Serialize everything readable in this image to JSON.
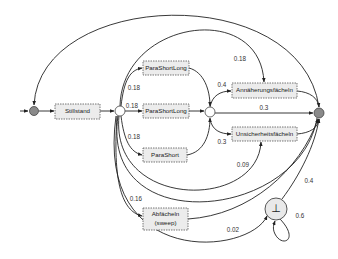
{
  "diagram": {
    "type": "probabilistic-state-machine",
    "nodes": {
      "start": {
        "kind": "initial",
        "label": ""
      },
      "stillstand": {
        "label": "Stillstand"
      },
      "split": {
        "kind": "choice",
        "label": ""
      },
      "parashortlong_1": {
        "label": "ParaShortLong"
      },
      "parashortlong_2": {
        "label": "ParaShortLong"
      },
      "parashort": {
        "label": "ParaShort"
      },
      "abfaecheln": {
        "label": "Abfächeln",
        "sublabel": "(sweep)"
      },
      "merge": {
        "kind": "choice",
        "label": ""
      },
      "annaeherung": {
        "label": "Annäherungsfächeln"
      },
      "unsicherheit": {
        "label": "Unsicherheitsfächeln"
      },
      "end": {
        "kind": "junction",
        "label": ""
      },
      "bottom": {
        "kind": "absorbing",
        "label": "⊥"
      }
    },
    "edges": [
      {
        "from": "start",
        "to": "stillstand",
        "label": ""
      },
      {
        "from": "stillstand",
        "to": "split",
        "label": ""
      },
      {
        "from": "split",
        "to": "parashortlong_1",
        "label": "0.18"
      },
      {
        "from": "split",
        "to": "parashortlong_2",
        "label": "0.18"
      },
      {
        "from": "split",
        "to": "parashort",
        "label": "0.18"
      },
      {
        "from": "split",
        "to": "annaeherung",
        "label": "0.18"
      },
      {
        "from": "split",
        "to": "unsicherheit",
        "label": "0.09"
      },
      {
        "from": "split",
        "to": "abfaecheln",
        "label": "0.16"
      },
      {
        "from": "split",
        "to": "bottom",
        "label": "0.02"
      },
      {
        "from": "parashortlong_1",
        "to": "merge",
        "label": ""
      },
      {
        "from": "parashortlong_2",
        "to": "merge",
        "label": ""
      },
      {
        "from": "parashort",
        "to": "merge",
        "label": ""
      },
      {
        "from": "merge",
        "to": "annaeherung",
        "label": "0.4"
      },
      {
        "from": "merge",
        "to": "end",
        "label": "0.3"
      },
      {
        "from": "merge",
        "to": "unsicherheit",
        "label": "0.3"
      },
      {
        "from": "annaeherung",
        "to": "end",
        "label": ""
      },
      {
        "from": "unsicherheit",
        "to": "end",
        "label": ""
      },
      {
        "from": "abfaecheln",
        "to": "end",
        "label": ""
      },
      {
        "from": "bottom",
        "to": "end",
        "label": "0.4"
      },
      {
        "from": "bottom",
        "to": "bottom",
        "label": "0.6"
      },
      {
        "from": "end",
        "to": "start",
        "label": ""
      }
    ]
  }
}
